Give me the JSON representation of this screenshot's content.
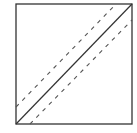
{
  "diagram": {
    "colors": {
      "stroke": "#333333",
      "dashed": "#555555",
      "background": "#ffffff"
    },
    "square": {
      "x": 16,
      "y": 4,
      "width": 116,
      "height": 120
    },
    "lines": [
      {
        "name": "main-diagonal",
        "style": "solid",
        "x1": 16,
        "y1": 124,
        "x2": 132,
        "y2": 4
      },
      {
        "name": "upper-dashed",
        "style": "dashed",
        "x1": 16,
        "y1": 107,
        "x2": 116,
        "y2": 4
      },
      {
        "name": "lower-dashed",
        "style": "dashed",
        "x1": 30,
        "y1": 124,
        "x2": 132,
        "y2": 20
      }
    ]
  }
}
